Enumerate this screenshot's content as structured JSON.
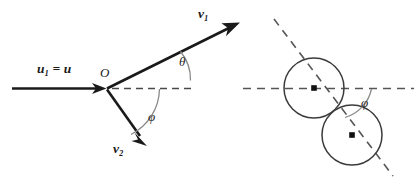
{
  "figure": {
    "background_color": "#ffffff",
    "ink_color": "#1a1a1a",
    "dash_color": "#4a4a4a",
    "arc_color": "#8a8a8a",
    "circle_color": "#3b3b3b"
  },
  "left_panel": {
    "name": "vector-diagram",
    "origin_label": "O",
    "incoming": {
      "label_main": "u",
      "label_sub": "1",
      "label_equals": " = u",
      "full_label": "u₁ = u"
    },
    "outgoing_upper": {
      "label_main": "v",
      "label_sub": "1",
      "full_label": "v₁"
    },
    "outgoing_lower": {
      "label_main": "v",
      "label_sub": "2",
      "full_label": "v₂"
    },
    "angle_upper": {
      "symbol": "θ",
      "name": "theta"
    },
    "angle_lower": {
      "symbol": "φ",
      "name": "phi"
    },
    "axis_name": "horizontal-reference-axis"
  },
  "right_panel": {
    "name": "spheres-diagram",
    "angle": {
      "symbol": "φ",
      "name": "phi"
    },
    "circle_count": 2,
    "circles": [
      {
        "name": "sphere-upper-left",
        "cx": 314,
        "cy": 88,
        "r": 30
      },
      {
        "name": "sphere-lower-right",
        "cx": 352,
        "cy": 135,
        "r": 30
      }
    ],
    "horizontal_axis_name": "horizontal-reference-axis",
    "centerline_name": "line-of-centers"
  }
}
